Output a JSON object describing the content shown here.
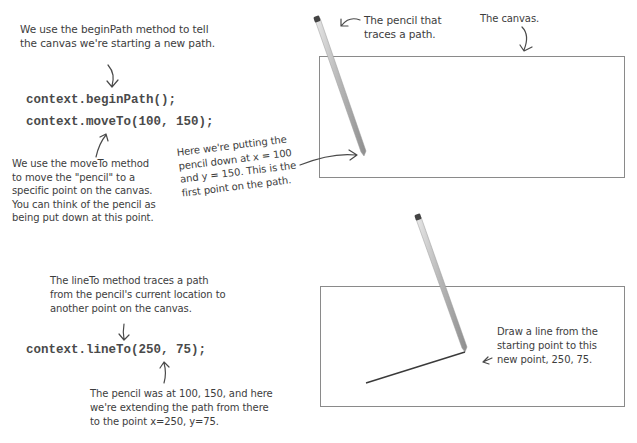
{
  "top_section": {
    "begin_path_note": "We use the beginPath method to tell\nthe canvas we're starting a new path.",
    "code_line_1": "context.beginPath();",
    "code_line_2": "context.moveTo(100, 150);",
    "move_to_note": "We use the moveTo method\nto move the \"pencil\" to a\nspecific point on the canvas.\nYou can think of the pencil as\nbeing put down at this point.",
    "putting_down_note": "Here we're putting the\npencil down at x = 100\nand y = 150. This is the\nfirst point on the path.",
    "pencil_label": "The pencil that\ntraces a path.",
    "canvas_label": "The canvas."
  },
  "bottom_section": {
    "line_to_note": "The lineTo method traces a path\nfrom the pencil's current location to\nanother point on the canvas.",
    "code_line": "context.lineTo(250, 75);",
    "extending_note": "The pencil was at 100, 150, and here\nwe're extending the path from there\nto the point x=250, y=75.",
    "draw_line_note": "Draw a line from the\nstarting point to this\nnew point, 250, 75."
  },
  "diagram": {
    "canvas_1": {
      "moveTo": [
        100,
        150
      ]
    },
    "canvas_2": {
      "moveTo": [
        100,
        150
      ],
      "lineTo": [
        250,
        75
      ]
    },
    "colors": {
      "border": "#8a8a8a",
      "ink": "#3d3d3d",
      "pencil": "#b8b8b8"
    }
  }
}
